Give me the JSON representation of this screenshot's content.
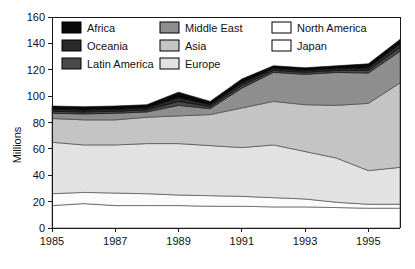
{
  "chart_data": {
    "type": "area",
    "stacked": true,
    "title": "",
    "xlabel": "",
    "ylabel": "Millions",
    "xlim": [
      1985,
      1996
    ],
    "ylim": [
      0,
      160
    ],
    "ytick_step": 20,
    "yticks": [
      0,
      20,
      40,
      60,
      80,
      100,
      120,
      140,
      160
    ],
    "ytick_labels": [
      "0",
      "20",
      "40",
      "60",
      "80",
      "100",
      "120",
      "140",
      "160"
    ],
    "x": [
      1985,
      1986,
      1987,
      1988,
      1989,
      1990,
      1991,
      1992,
      1993,
      1994,
      1995,
      1996
    ],
    "xticks": [
      1985,
      1987,
      1989,
      1991,
      1993,
      1995
    ],
    "xtick_labels": [
      "1985",
      "1987",
      "1989",
      "1991",
      "1993",
      "1995"
    ],
    "grid": false,
    "legend_position": "top-inside",
    "legend_columns": 3,
    "stack_order_bottom_to_top": [
      "Japan",
      "North America",
      "Europe",
      "Asia",
      "Middle East",
      "Latin America",
      "Oceania",
      "Africa"
    ],
    "series": [
      {
        "name": "Japan",
        "color": "#ffffff",
        "values": [
          17,
          18.5,
          17,
          17,
          17,
          16.5,
          16.5,
          16,
          16,
          15.5,
          15,
          15
        ]
      },
      {
        "name": "North America",
        "color": "#fbfbfb",
        "values": [
          9,
          8.5,
          9.5,
          9,
          8,
          8,
          7.5,
          7,
          6,
          4,
          3,
          3
        ]
      },
      {
        "name": "Europe",
        "color": "#e2e2e2",
        "values": [
          39,
          36,
          36.5,
          38,
          39,
          38,
          37,
          40,
          36,
          33.5,
          25.5,
          28
        ]
      },
      {
        "name": "Asia",
        "color": "#c4c4c4",
        "values": [
          18,
          19,
          19,
          20,
          21,
          23.5,
          30,
          33,
          35.5,
          40,
          51,
          64
        ]
      },
      {
        "name": "Middle East",
        "color": "#8e8e8e",
        "values": [
          4,
          4.5,
          5,
          4,
          8,
          4.5,
          15,
          22,
          23,
          25,
          23,
          24
        ]
      },
      {
        "name": "Latin America",
        "color": "#4a4a4a",
        "values": [
          1.5,
          1.5,
          1.5,
          1.5,
          3,
          1.5,
          2,
          1.5,
          1.5,
          1.5,
          2,
          3
        ]
      },
      {
        "name": "Oceania",
        "color": "#2a2a2a",
        "values": [
          1.5,
          1.5,
          1.5,
          1.5,
          3,
          1.5,
          2,
          1.5,
          1.5,
          1.5,
          2,
          3
        ]
      },
      {
        "name": "Africa",
        "color": "#0a0a0a",
        "values": [
          2.5,
          2.5,
          2.5,
          2.5,
          4,
          2.5,
          3,
          2,
          2,
          2,
          3,
          3
        ]
      }
    ],
    "totals": [
      92.5,
      92,
      92.5,
      93.5,
      103,
      96,
      113,
      123,
      121.5,
      123,
      124.5,
      143
    ]
  },
  "legend": {
    "items": [
      {
        "label": "Africa",
        "color": "#0a0a0a",
        "column": 1
      },
      {
        "label": "Oceania",
        "color": "#2a2a2a",
        "column": 1
      },
      {
        "label": "Latin America",
        "color": "#4a4a4a",
        "column": 1
      },
      {
        "label": "Middle East",
        "color": "#8e8e8e",
        "column": 2
      },
      {
        "label": "Asia",
        "color": "#c4c4c4",
        "column": 2
      },
      {
        "label": "Europe",
        "color": "#e2e2e2",
        "column": 2
      },
      {
        "label": "North America",
        "color": "#ffffff",
        "column": 3
      },
      {
        "label": "Japan",
        "color": "#ffffff",
        "column": 3
      }
    ]
  },
  "axes": {
    "y_title": "Millions"
  }
}
